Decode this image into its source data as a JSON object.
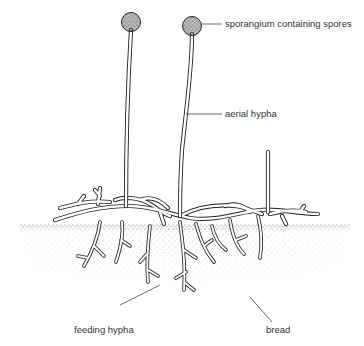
{
  "diagram": {
    "labels": {
      "sporangium": "sporangium containing spores",
      "aerial_hypha": "aerial hypha",
      "feeding_hypha": "feeding hypha",
      "bread": "bread"
    },
    "colors": {
      "line": "#222222",
      "label_text": "#333333",
      "leader": "#444444",
      "stipple": "#777777"
    }
  }
}
